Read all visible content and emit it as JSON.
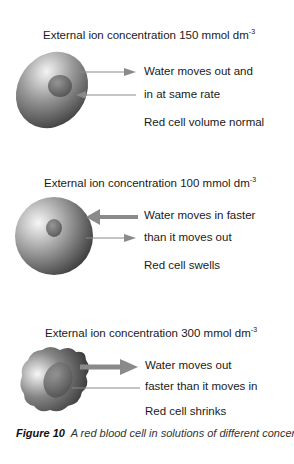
{
  "panels": [
    {
      "title": "External ion concentration 150 mmol dm",
      "title_sup": "-3",
      "lines": [
        "Water moves out and",
        "in at same rate",
        "Red cell volume normal"
      ],
      "cell_shape": "biconcave-disc",
      "arrows": [
        {
          "direction": "out",
          "weight": "thin"
        },
        {
          "direction": "in",
          "weight": "thin"
        }
      ]
    },
    {
      "title": "External ion concentration 100 mmol dm",
      "title_sup": "-3",
      "lines": [
        "Water moves in faster",
        "than it moves out",
        "Red cell swells"
      ],
      "cell_shape": "swollen-sphere",
      "arrows": [
        {
          "direction": "in",
          "weight": "thick"
        },
        {
          "direction": "out",
          "weight": "thin"
        }
      ]
    },
    {
      "title": "External ion concentration 300 mmol dm",
      "title_sup": "-3",
      "lines": [
        "Water moves out",
        "faster than it moves in",
        "Red cell shrinks"
      ],
      "cell_shape": "crenated",
      "arrows": [
        {
          "direction": "out",
          "weight": "thick"
        },
        {
          "direction": "in",
          "weight": "thin"
        }
      ]
    }
  ],
  "caption": {
    "label": "Figure 10",
    "text": "A red blood cell in solutions of different concentrations"
  },
  "colors": {
    "cell_light": "#f2f2f2",
    "cell_mid": "#8c8c8c",
    "cell_dark": "#3a3a3a",
    "arrow": "#8a8a8a"
  }
}
